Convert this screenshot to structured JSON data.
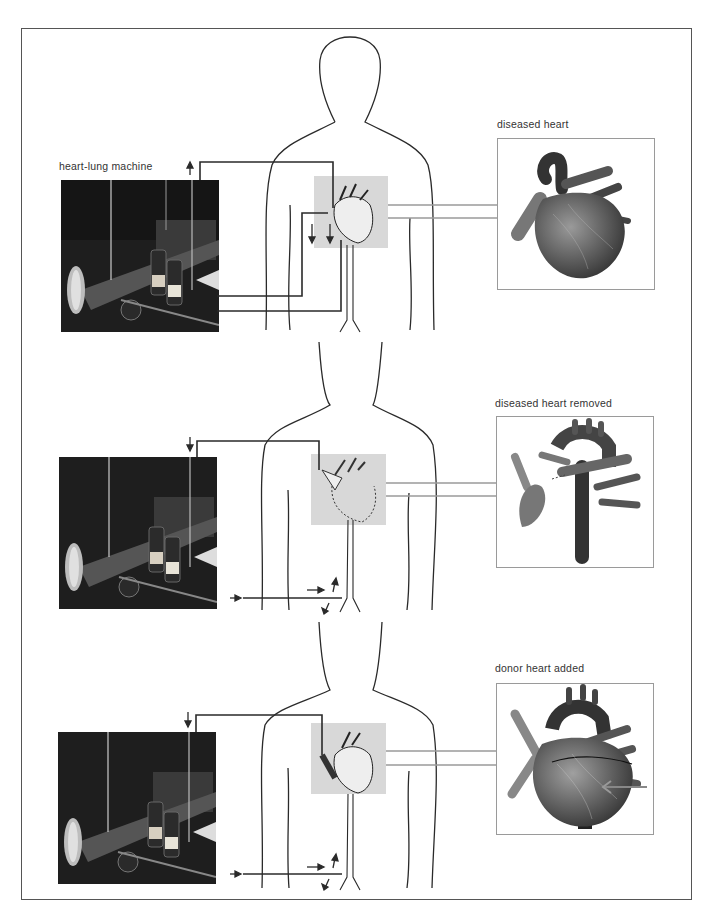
{
  "figure": {
    "colors": {
      "line": "#2a2a2a",
      "panel_border": "#9a9a9a",
      "highlight": "#d8d8d8",
      "frame": "#555555"
    }
  },
  "stages": [
    {
      "machine_label": "heart-lung machine",
      "heart_label": "diseased heart",
      "flow_arrows": [
        "up-arrow-on-machine-tube",
        "down-arrow-left-chest",
        "down-arrow-right-chest"
      ]
    },
    {
      "machine_label": "",
      "heart_label": "diseased heart removed",
      "flow_arrows": [
        "down-arrow-on-machine-tube",
        "right-arrow-to-femoral",
        "right-arrow-near-groin",
        "up-arrow-near-groin",
        "down-left-arrow-near-groin"
      ]
    },
    {
      "machine_label": "",
      "heart_label": "donor heart added",
      "flow_arrows": [
        "down-arrow-on-machine-tube",
        "right-arrow-to-femoral",
        "right-arrow-near-groin",
        "up-arrow-near-groin",
        "down-left-arrow-near-groin"
      ]
    }
  ]
}
